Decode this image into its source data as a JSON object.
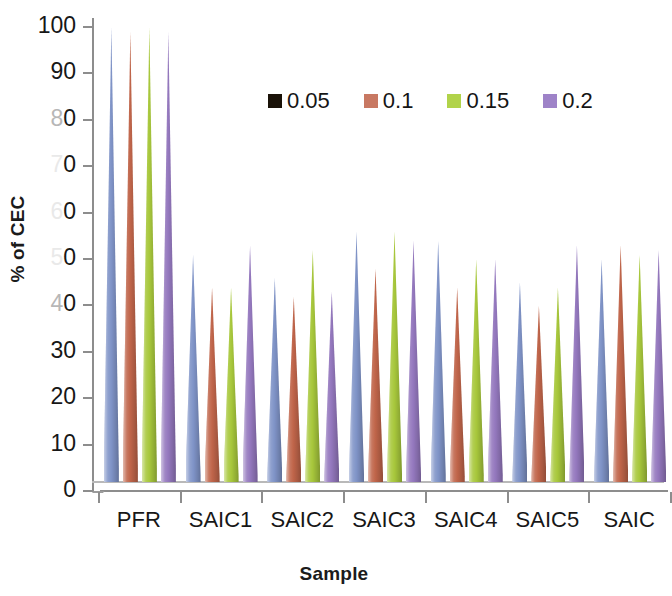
{
  "chart_data": {
    "type": "bar",
    "chart_style": "3d-cone-clustered-column",
    "title": "",
    "xlabel": "Sample",
    "ylabel": "% of CEC",
    "categories": [
      "PFR",
      "SAIC1",
      "SAIC2",
      "SAIC3",
      "SAIC4",
      "SAIC5",
      "SAIC"
    ],
    "ylim": [
      0,
      100
    ],
    "y_ticks": [
      0,
      10,
      20,
      30,
      40,
      50,
      60,
      70,
      80,
      90,
      100
    ],
    "y_tick_labels": [
      "0",
      "10",
      "20",
      "30",
      "40",
      "50",
      "60",
      "70",
      "80",
      "90",
      "100"
    ],
    "grid": false,
    "legend_position": "top-center",
    "series": [
      {
        "name": "0.05",
        "color": "#8094c8",
        "legend_swatch_color": "#1a1208",
        "values": [
          98,
          49,
          44,
          54,
          52,
          43,
          48
        ]
      },
      {
        "name": "0.1",
        "color": "#c0654a",
        "legend_swatch_color": "#c87862",
        "values": [
          97,
          42,
          40,
          46,
          42,
          38,
          51
        ]
      },
      {
        "name": "0.15",
        "color": "#a8c83c",
        "legend_swatch_color": "#b1d34a",
        "values": [
          98,
          42,
          50,
          54,
          48,
          42,
          49
        ]
      },
      {
        "name": "0.2",
        "color": "#9478be",
        "legend_swatch_color": "#9e83c8",
        "values": [
          97,
          51,
          41,
          52,
          48,
          51,
          50
        ]
      }
    ]
  },
  "axes": {
    "y_title": "% of CEC",
    "x_title": "Sample"
  },
  "legend": {
    "entries": [
      {
        "label": "0.05"
      },
      {
        "label": "0.1"
      },
      {
        "label": "0.15"
      },
      {
        "label": "0.2"
      }
    ]
  },
  "colors": {
    "axis": "#8d8d8d",
    "text": "#171717",
    "background": "#ffffff"
  }
}
